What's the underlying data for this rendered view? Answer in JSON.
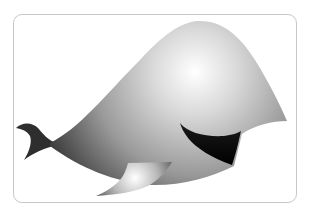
{
  "illustration": {
    "subject": "whale",
    "style": "grayscale gradient",
    "colors": {
      "frame_border": "#c8c8c8",
      "body_light": "#ffffff",
      "body_dark": "#3a3a3a",
      "tail": "#2e2e2e",
      "mouth": "#0a0a0a",
      "fin_light": "#f4f4f4",
      "fin_dark": "#5a5a5a"
    }
  }
}
